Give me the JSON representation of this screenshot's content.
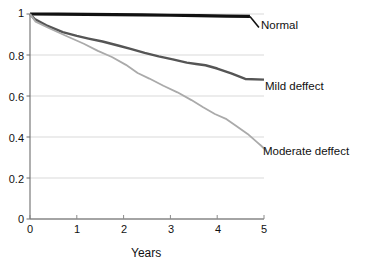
{
  "chart_data": {
    "type": "line",
    "title": "",
    "subtitle": "",
    "xlabel": "Years",
    "ylabel": "",
    "xlim": [
      0,
      5
    ],
    "ylim": [
      0,
      1
    ],
    "xticks": [
      "0",
      "1",
      "2",
      "3",
      "4",
      "5"
    ],
    "xtick_values": [
      0,
      1,
      2,
      3,
      4,
      5
    ],
    "yticks": [
      "0",
      "0.2",
      "0.4",
      "0.6",
      "0.8",
      "1"
    ],
    "ytick_values": [
      0,
      0.2,
      0.4,
      0.6,
      0.8,
      1
    ],
    "grid": "horizontal",
    "legend_position": "inline-right-end-labels",
    "series": [
      {
        "name": "Normal",
        "color": "#111111",
        "width": 3.2,
        "label": "Normal",
        "label_x": 4.72,
        "label_y": 0.955,
        "x": [
          0.0,
          0.6,
          1.2,
          1.8,
          2.4,
          3.0,
          3.6,
          4.2,
          4.7
        ],
        "values": [
          1.0,
          0.999,
          0.998,
          0.997,
          0.996,
          0.994,
          0.992,
          0.99,
          0.988
        ]
      },
      {
        "name": "Mild deffect",
        "color": "#555555",
        "width": 2.4,
        "label": "Mild deffect",
        "label_x": 5.03,
        "label_y": 0.665,
        "x": [
          0.0,
          0.1,
          0.35,
          0.7,
          1.0,
          1.25,
          1.55,
          1.9,
          2.15,
          2.45,
          2.75,
          3.05,
          3.35,
          3.55,
          3.75,
          4.0,
          4.3,
          4.6,
          5.0
        ],
        "values": [
          1.0,
          0.975,
          0.945,
          0.912,
          0.893,
          0.88,
          0.866,
          0.845,
          0.83,
          0.81,
          0.793,
          0.779,
          0.763,
          0.756,
          0.75,
          0.734,
          0.71,
          0.683,
          0.68
        ]
      },
      {
        "name": "Moderate deffect",
        "color": "#aaaaaa",
        "width": 1.8,
        "label": "Moderate deffect",
        "label_x": 5.03,
        "label_y": 0.335,
        "x": [
          0.0,
          0.12,
          0.4,
          0.8,
          1.15,
          1.45,
          1.75,
          2.05,
          2.3,
          2.55,
          2.85,
          3.15,
          3.45,
          3.7,
          3.95,
          4.2,
          4.4,
          4.65,
          4.85,
          5.0
        ],
        "values": [
          1.0,
          0.963,
          0.932,
          0.89,
          0.855,
          0.82,
          0.79,
          0.752,
          0.712,
          0.685,
          0.65,
          0.618,
          0.58,
          0.545,
          0.512,
          0.487,
          0.455,
          0.415,
          0.375,
          0.345
        ]
      }
    ]
  },
  "geometry": {
    "plot_left": 30,
    "plot_right": 264,
    "plot_top": 14,
    "plot_bottom": 219
  }
}
